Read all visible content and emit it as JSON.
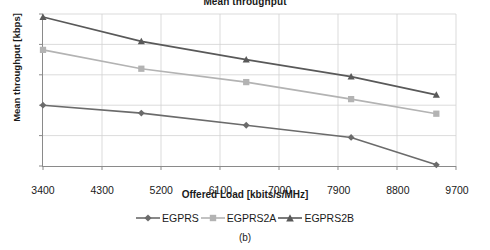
{
  "caption": "(b)",
  "chart_data": {
    "type": "line",
    "title": "Mean throughput",
    "xlabel": "Offered Load [kbits/s/MHz]",
    "ylabel": "Mean throughput [kbps]",
    "xlim": [
      3400,
      9700
    ],
    "ylim": [
      90,
      340
    ],
    "xticks": [
      3400,
      4300,
      5200,
      6100,
      7000,
      7900,
      8800,
      9700
    ],
    "yticks": [
      90,
      140,
      190,
      240,
      290,
      340
    ],
    "grid": true,
    "legend_position": "bottom",
    "x": [
      3400,
      4900,
      6500,
      8100,
      9400
    ],
    "series": [
      {
        "name": "EGPRS",
        "marker": "diamond",
        "color": "#6b6b6b",
        "values": [
          190,
          177,
          157,
          137,
          92
        ]
      },
      {
        "name": "EGPRS2A",
        "marker": "square",
        "color": "#b3b3b3",
        "values": [
          281,
          250,
          228,
          200,
          176
        ]
      },
      {
        "name": "EGPRS2B",
        "marker": "triangle",
        "color": "#595959",
        "values": [
          335,
          295,
          265,
          237,
          207
        ]
      }
    ]
  }
}
